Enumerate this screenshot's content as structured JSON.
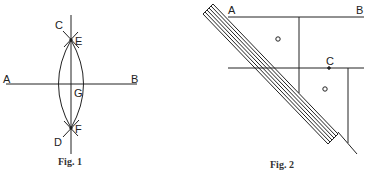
{
  "fig1": {
    "caption": "Fig. 1",
    "labels": {
      "A": "A",
      "B": "B",
      "C": "C",
      "D": "D",
      "E": "E",
      "F": "F",
      "G": "G"
    }
  },
  "fig2": {
    "caption": "Fig. 2",
    "labels": {
      "A": "A",
      "B": "B",
      "C": "C"
    },
    "markers": [
      "o",
      "o"
    ]
  },
  "colors": {
    "line": "#222222",
    "background": "#ffffff"
  }
}
